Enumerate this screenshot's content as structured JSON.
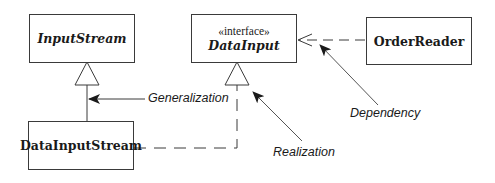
{
  "diagram": {
    "type": "uml-class-relationships",
    "classes": [
      {
        "id": "input-stream",
        "name": "InputStream",
        "stereotype": "",
        "italic": true
      },
      {
        "id": "data-input",
        "name": "DataInput",
        "stereotype": "«interface»",
        "italic": true
      },
      {
        "id": "order-reader",
        "name": "OrderReader",
        "stereotype": "",
        "italic": false
      },
      {
        "id": "data-input-stream",
        "name": "DataInputStream",
        "stereotype": "",
        "italic": false
      }
    ],
    "relationships": [
      {
        "kind": "generalization",
        "from": "DataInputStream",
        "to": "InputStream",
        "line": "solid",
        "head": "hollow-triangle"
      },
      {
        "kind": "realization",
        "from": "DataInputStream",
        "to": "DataInput",
        "line": "dashed",
        "head": "hollow-triangle"
      },
      {
        "kind": "dependency",
        "from": "OrderReader",
        "to": "DataInput",
        "line": "dashed",
        "head": "open-arrow"
      }
    ],
    "annotations": [
      {
        "text": "Generalization",
        "points_to": "generalization"
      },
      {
        "text": "Realization",
        "points_to": "realization"
      },
      {
        "text": "Dependency",
        "points_to": "dependency"
      }
    ],
    "colors": {
      "line": "#3a3a3a",
      "text": "#1a1a1a",
      "background": "#ffffff"
    }
  }
}
